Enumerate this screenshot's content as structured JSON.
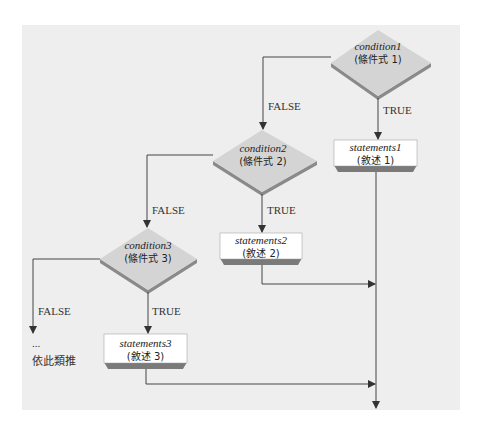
{
  "diagram": {
    "type": "flowchart",
    "nodes": [
      {
        "id": "cond1",
        "shape": "diamond",
        "label": "condition1",
        "sublabel": "(條件式 1)"
      },
      {
        "id": "cond2",
        "shape": "diamond",
        "label": "condition2",
        "sublabel": "(條件式 2)"
      },
      {
        "id": "cond3",
        "shape": "diamond",
        "label": "condition3",
        "sublabel": "(條件式 3)"
      },
      {
        "id": "stmt1",
        "shape": "box",
        "label": "statements1",
        "sublabel": "(敘述 1)"
      },
      {
        "id": "stmt2",
        "shape": "box",
        "label": "statements2",
        "sublabel": "(敘述 2)"
      },
      {
        "id": "stmt3",
        "shape": "box",
        "label": "statements3",
        "sublabel": "(敘述 3)"
      }
    ],
    "edges": [
      {
        "from": "cond1",
        "to": "stmt1",
        "label": "TRUE"
      },
      {
        "from": "cond1",
        "to": "cond2",
        "label": "FALSE"
      },
      {
        "from": "cond2",
        "to": "stmt2",
        "label": "TRUE"
      },
      {
        "from": "cond2",
        "to": "cond3",
        "label": "FALSE"
      },
      {
        "from": "cond3",
        "to": "stmt3",
        "label": "TRUE"
      },
      {
        "from": "cond3",
        "to": "etc",
        "label": "FALSE"
      }
    ],
    "continuation": {
      "ellipsis": "...",
      "text": "依此類推"
    },
    "edge_labels": {
      "true1": "TRUE",
      "false1": "FALSE",
      "true2": "TRUE",
      "false2": "FALSE",
      "true3": "TRUE",
      "false3": "FALSE"
    },
    "colors": {
      "background": "#eeeeee",
      "diamond_face": "#d4d4d4",
      "diamond_shadow": "#8a8a8a",
      "box_face": "#ffffff",
      "box_shadow": "#7a7a7a",
      "line": "#444444"
    }
  }
}
